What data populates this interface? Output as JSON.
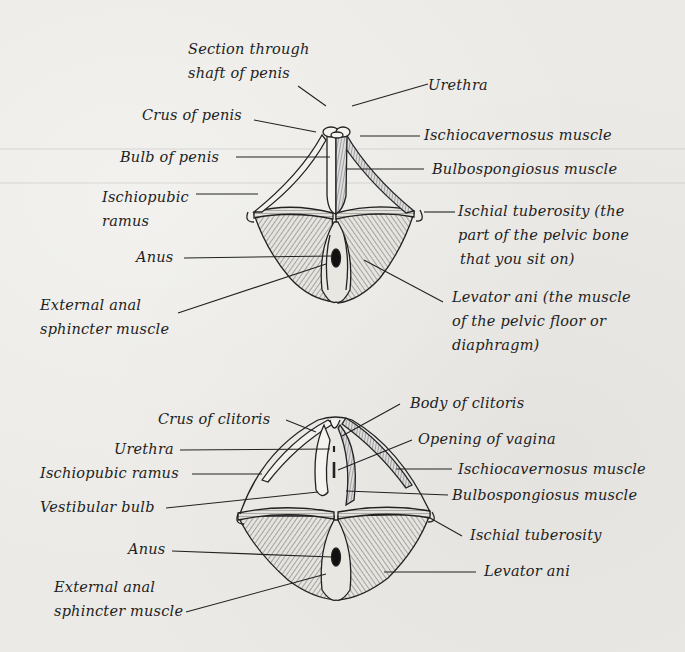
{
  "male_diagram": {
    "labels": {
      "section_line1": "Section through",
      "section_line2": "shaft of penis",
      "urethra": "Urethra",
      "crus": "Crus of penis",
      "ischiocavernosus": "Ischiocavernosus muscle",
      "bulb": "Bulb of penis",
      "bulbospongiosus": "Bulbospongiosus muscle",
      "ischiopubic_line1": "Ischiopubic",
      "ischiopubic_line2": "ramus",
      "ischial_line1": "Ischial tuberosity (the",
      "ischial_line2": "part of the pelvic bone",
      "ischial_line3": "that you sit on)",
      "anus": "Anus",
      "external_anal_line1": "External anal",
      "external_anal_line2": "sphincter muscle",
      "levator_line1": "Levator ani (the muscle",
      "levator_line2": "of the pelvic floor or",
      "levator_line3": "diaphragm)"
    }
  },
  "female_diagram": {
    "labels": {
      "crus": "Crus of clitoris",
      "body": "Body of clitoris",
      "urethra": "Urethra",
      "opening_vagina": "Opening of vagina",
      "ischiopubic": "Ischiopubic ramus",
      "ischiocavernosus": "Ischiocavernosus muscle",
      "vestibular_bulb": "Vestibular bulb",
      "bulbospongiosus": "Bulbospongiosus muscle",
      "ischial": "Ischial tuberosity",
      "anus": "Anus",
      "levator": "Levator ani",
      "external_anal_line1": "External anal",
      "external_anal_line2": "sphincter muscle"
    }
  },
  "colors": {
    "ink": "#1e1e1e",
    "paper": "#ebeae6",
    "muscle_fill": "#d9d7d2"
  }
}
